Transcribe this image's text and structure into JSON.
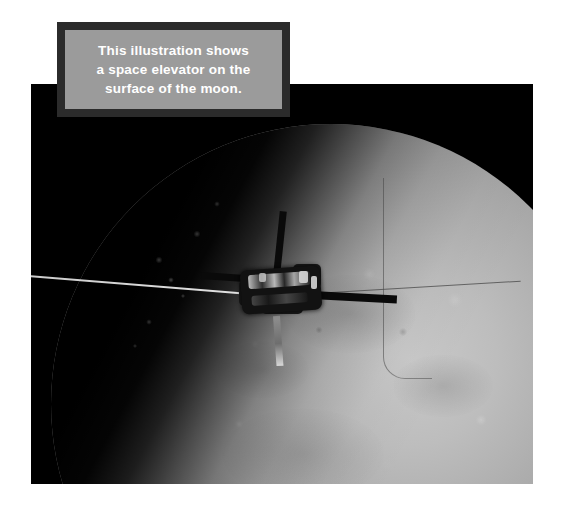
{
  "page": {
    "background_color": "#ffffff",
    "width": 563,
    "height": 511
  },
  "photo": {
    "name": "moon-space-elevator-illustration",
    "background_color": "#000000",
    "subject": "moon",
    "moon": {
      "surface_color": "#a8a8a8",
      "shadow_color": "#000000",
      "description": "gray cratered lunar disc lit from the right with terminator shadow on the upper left"
    },
    "elevator": {
      "name": "space-elevator",
      "structure_color": "#0a0a0a",
      "strut_color": "#8f8f8f",
      "tether_color": "#e0e0e0",
      "description": "space elevator station with solar arms and a tether running off to the left"
    }
  },
  "caption": {
    "border_color": "#2b2b2b",
    "background_color": "#9b9b9b",
    "text_color": "#ffffff",
    "full_text": "This illustration shows a space elevator on the surface of the moon.",
    "lines": [
      "This illustration shows",
      "a space elevator on the",
      "surface of the moon."
    ]
  }
}
